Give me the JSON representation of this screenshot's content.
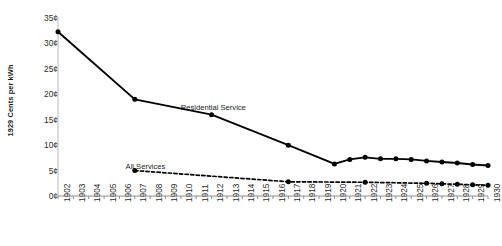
{
  "chart_data": {
    "type": "line",
    "title": "",
    "xlabel": "",
    "ylabel": "1929 Cents per kWh",
    "ylim": [
      0,
      35
    ],
    "xlim": [
      1902,
      1930
    ],
    "grid": false,
    "legend_position": "inline-annotation",
    "ytick_labels": [
      "0¢",
      "5¢",
      "10¢",
      "15¢",
      "20¢",
      "25¢",
      "30¢",
      "35¢"
    ],
    "ytick_values": [
      0,
      5,
      10,
      15,
      20,
      25,
      30,
      35
    ],
    "x": [
      1902,
      1903,
      1904,
      1905,
      1906,
      1907,
      1908,
      1909,
      1910,
      1911,
      1912,
      1913,
      1914,
      1915,
      1916,
      1917,
      1918,
      1919,
      1920,
      1921,
      1922,
      1923,
      1924,
      1925,
      1926,
      1927,
      1928,
      1929,
      1930
    ],
    "xtick_labels": [
      "1902",
      "1903",
      "1904",
      "1905",
      "1906",
      "1907",
      "1908",
      "1909",
      "1910",
      "1911",
      "1912",
      "1913",
      "1914",
      "1915",
      "1916",
      "1917",
      "1918",
      "1919",
      "1920",
      "1921",
      "1922",
      "1923",
      "1924",
      "1925",
      "1926",
      "1927",
      "1928",
      "1929",
      "1930"
    ],
    "series": [
      {
        "name": "Residential Service",
        "style": "solid",
        "color": "#000000",
        "label_x": 1910.0,
        "label_y": 18.2,
        "points": [
          {
            "x": 1902,
            "y": 32.3,
            "marker": true
          },
          {
            "x": 1907,
            "y": 19.0,
            "marker": true
          },
          {
            "x": 1912,
            "y": 16.0,
            "marker": true
          },
          {
            "x": 1917,
            "y": 10.0,
            "marker": true
          },
          {
            "x": 1920,
            "y": 6.3,
            "marker": true
          },
          {
            "x": 1921,
            "y": 7.2,
            "marker": true
          },
          {
            "x": 1922,
            "y": 7.6,
            "marker": true
          },
          {
            "x": 1923,
            "y": 7.3,
            "marker": true
          },
          {
            "x": 1924,
            "y": 7.3,
            "marker": true
          },
          {
            "x": 1925,
            "y": 7.2,
            "marker": true
          },
          {
            "x": 1926,
            "y": 6.9,
            "marker": true
          },
          {
            "x": 1927,
            "y": 6.7,
            "marker": true
          },
          {
            "x": 1928,
            "y": 6.5,
            "marker": true
          },
          {
            "x": 1929,
            "y": 6.2,
            "marker": true
          },
          {
            "x": 1930,
            "y": 6.0,
            "marker": true
          }
        ]
      },
      {
        "name": "All Services",
        "style": "dashed",
        "color": "#000000",
        "label_x": 1906.4,
        "label_y": 6.6,
        "points": [
          {
            "x": 1907,
            "y": 5.0,
            "marker": true
          },
          {
            "x": 1917,
            "y": 2.8,
            "marker": true
          },
          {
            "x": 1922,
            "y": 2.7,
            "marker": true
          },
          {
            "x": 1926,
            "y": 2.5,
            "marker": true
          },
          {
            "x": 1927,
            "y": 2.4,
            "marker": true
          },
          {
            "x": 1928,
            "y": 2.3,
            "marker": true
          },
          {
            "x": 1929,
            "y": 2.2,
            "marker": true
          },
          {
            "x": 1930,
            "y": 2.1,
            "marker": true
          }
        ]
      }
    ]
  }
}
